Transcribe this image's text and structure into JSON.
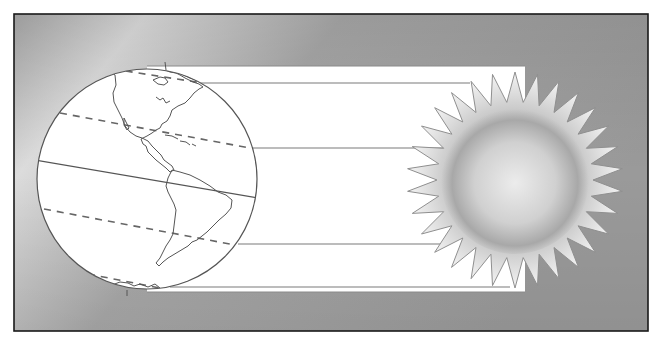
{
  "diagram": {
    "title": "",
    "colors": {
      "frame_border": "#1a1a1a",
      "background_light": "#d9d9d9",
      "background_dark": "#8f8f8f",
      "band_fill": "#ffffff",
      "line_color": "#777777",
      "earth_fill": "#ffffff",
      "earth_outline": "#555555",
      "sun_core_light": "#eeeeee",
      "sun_core_dark": "#9a9a9a",
      "sun_spike_outline": "#8a8a8a"
    },
    "elements": {
      "earth": {
        "label": "Earth",
        "shows": "North and South America",
        "lat_lines": [
          "Arctic Circle",
          "Tropic of Cancer",
          "Equator",
          "Tropic of Capricorn",
          "Antarctic Circle"
        ]
      },
      "sun": {
        "label": "Sun",
        "spike_count": 30
      },
      "rays": {
        "label": "Parallel sun rays",
        "count": 4
      }
    }
  }
}
